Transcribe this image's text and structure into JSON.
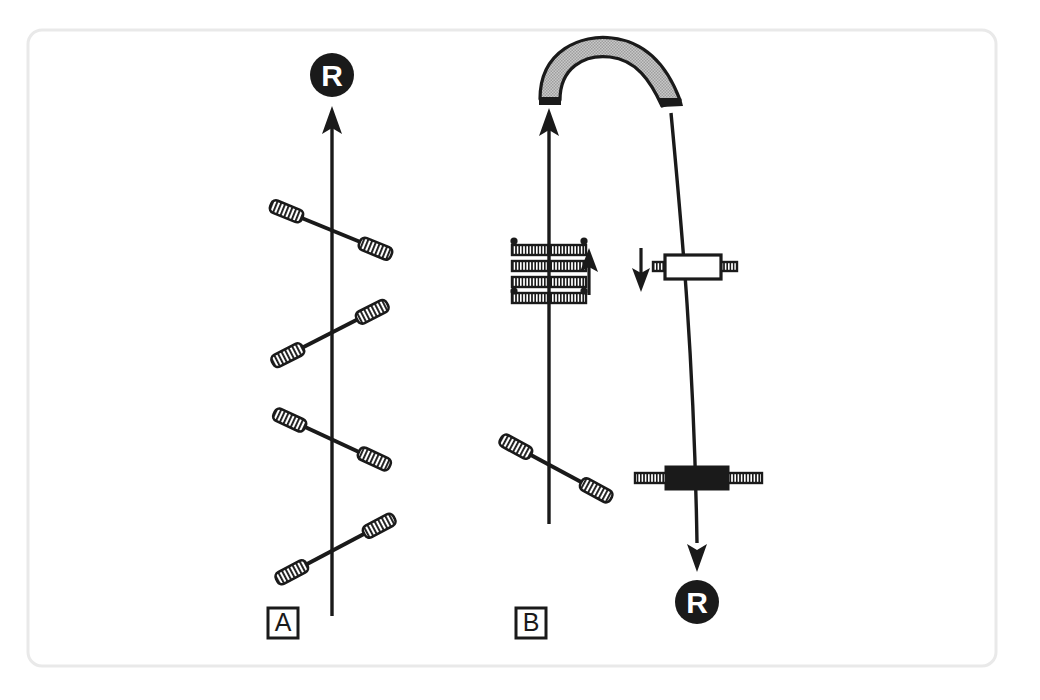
{
  "figure": {
    "caption_absent": true,
    "background_color": "#ffffff",
    "frame": {
      "name": "figure-border",
      "stroke_color": "#e9e9e9",
      "corner_radius": 14,
      "x": 28,
      "y": 30,
      "width": 968,
      "height": 636
    },
    "ink_color": "#1a1a1a",
    "arc_fill_color": "#b0b0b0"
  },
  "panels": [
    {
      "id": "A",
      "label": "A",
      "label_box": {
        "x": 268,
        "y": 608,
        "size": 30
      },
      "axis": {
        "name": "vertical-axis-a",
        "x": 332,
        "y_top": 112,
        "y_bottom": 616,
        "arrow": "up",
        "arrow_at": "top"
      },
      "marker": {
        "letter": "R",
        "name": "reaction-marker-top-a",
        "cx": 332,
        "cy": 75,
        "r": 22,
        "fill": "#1a1a1a",
        "text_color": "#ffffff"
      },
      "rods": [
        {
          "name": "dumbbell-rod-a-1",
          "x1": 287,
          "y1": 212,
          "x2": 375,
          "y2": 248,
          "slope": "down-right"
        },
        {
          "name": "dumbbell-rod-a-2",
          "x1": 288,
          "y1": 355,
          "x2": 372,
          "y2": 312,
          "slope": "up-right"
        },
        {
          "name": "dumbbell-rod-a-3",
          "x1": 290,
          "y1": 420,
          "x2": 374,
          "y2": 459,
          "slope": "down-right"
        },
        {
          "name": "dumbbell-rod-a-4",
          "x1": 292,
          "y1": 572,
          "x2": 379,
          "y2": 526,
          "slope": "up-right"
        }
      ]
    },
    {
      "id": "B",
      "label": "B",
      "label_box": {
        "x": 516,
        "y": 608,
        "size": 30
      },
      "axis_left": {
        "name": "vertical-axis-b-left",
        "x": 549,
        "y_top": 113,
        "y_bottom": 524,
        "arrow": "up",
        "arrow_at": "top"
      },
      "axis_right": {
        "name": "curved-axis-b-right",
        "x_top": 671,
        "y_top": 113,
        "x_bottom": 697,
        "y_bottom": 560,
        "arrow": "down",
        "arrow_at": "bottom"
      },
      "marker": {
        "letter": "R",
        "name": "reaction-marker-bottom-b",
        "cx": 697,
        "cy": 602,
        "r": 22,
        "fill": "#1a1a1a",
        "text_color": "#ffffff"
      },
      "arc": {
        "name": "bent-tube-arc",
        "fill": "#b0b0b0",
        "stroke": "#1a1a1a",
        "cap_fill": "#1a1a1a",
        "left_x": 549,
        "right_x": 671,
        "top_y": 52
      },
      "spring_stack": {
        "name": "spring-stack",
        "center_x": 549,
        "bar_count": 4,
        "bar_y": [
          249,
          265,
          281,
          297
        ],
        "bar_half_width": 37,
        "bar_height": 9,
        "corner_dots": [
          {
            "x": 518,
            "y": 244
          },
          {
            "x": 582,
            "y": 244
          },
          {
            "x": 518,
            "y": 291
          },
          {
            "x": 582,
            "y": 291
          }
        ]
      },
      "arrow_up_small": {
        "name": "force-arrow-up",
        "x": 588,
        "y_tail": 293,
        "y_head": 252,
        "direction": "up"
      },
      "arrow_down_small": {
        "name": "force-arrow-down",
        "x": 641,
        "y_tail": 248,
        "y_head": 290,
        "direction": "down"
      },
      "crossbar_open": {
        "name": "open-block-crossbar",
        "center_x": 691,
        "center_y": 268,
        "box_width": 56,
        "box_height": 24,
        "box_fill": "#ffffff",
        "hatch_half_span": 62
      },
      "crossbar_solid": {
        "name": "solid-block-crossbar",
        "center_x": 697,
        "center_y": 478,
        "box_width": 62,
        "box_height": 22,
        "box_fill": "#1a1a1a",
        "hatch_half_span": 64
      },
      "rods": [
        {
          "name": "dumbbell-rod-b-1",
          "x1": 516,
          "y1": 447,
          "x2": 596,
          "y2": 490,
          "slope": "down-right"
        }
      ]
    }
  ],
  "legend": {
    "dumbbell_description": "diagonal rod with hatched capsule weights at both ends",
    "marker_description": "filled black circle labelled R"
  }
}
